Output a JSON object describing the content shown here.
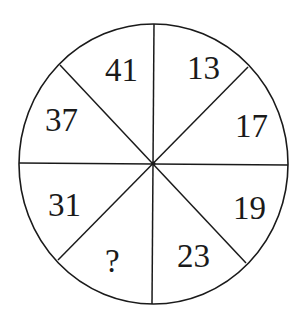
{
  "puzzle": {
    "type": "number-wheel",
    "segments": [
      {
        "position": "top-left",
        "value": "41"
      },
      {
        "position": "top-right",
        "value": "13"
      },
      {
        "position": "right-upper",
        "value": "17"
      },
      {
        "position": "right-lower",
        "value": "19"
      },
      {
        "position": "bottom-right",
        "value": "23"
      },
      {
        "position": "bottom-left",
        "value": "?"
      },
      {
        "position": "left-lower",
        "value": "31"
      },
      {
        "position": "left-upper",
        "value": "37"
      }
    ]
  }
}
